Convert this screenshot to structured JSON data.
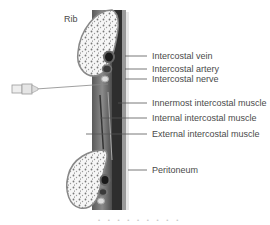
{
  "diagram": {
    "title_label": "Rib",
    "labels": [
      {
        "id": "vein",
        "text": "Intercostal vein"
      },
      {
        "id": "artery",
        "text": "Intercostal artery"
      },
      {
        "id": "nerve",
        "text": "Intercostal nerve"
      },
      {
        "id": "innermost",
        "text": "Innermost intercostal muscle"
      },
      {
        "id": "internal",
        "text": "Internal intercostal muscle"
      },
      {
        "id": "external",
        "text": "External intercostal muscle"
      },
      {
        "id": "peritoneum",
        "text": "Peritoneum"
      }
    ],
    "footer_dots": "• • • • • • • • •",
    "colors": {
      "bone_fill": "#f4f4f4",
      "muscle_dark": "#3a3a3a",
      "muscle_mid": "#6b6b6b",
      "label_text": "#4a4a4a"
    }
  }
}
